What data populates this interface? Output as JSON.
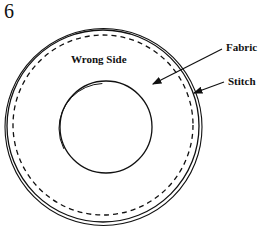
{
  "diagram": {
    "step_number": "6",
    "labels": {
      "wrong_side": "Wrong Side",
      "fabric": "Fabric",
      "stitch": "Stitch"
    },
    "colors": {
      "ink": "#111111",
      "background": "#ffffff"
    },
    "shapes": {
      "outer_circle": {
        "cx": 103,
        "cy": 126,
        "r": 96
      },
      "outer_circle_edge": {
        "cx": 103,
        "cy": 127,
        "r": 98
      },
      "stitch_line": {
        "cx": 103,
        "cy": 126,
        "r": 90,
        "style": "dashed"
      },
      "inner_circle": {
        "cx": 106,
        "cy": 127,
        "r": 46
      },
      "inner_circle_edge": {
        "cx": 104,
        "cy": 128,
        "r": 45
      }
    },
    "arrows": [
      {
        "label": "Fabric",
        "from": [
          222,
          49
        ],
        "to": [
          152,
          84
        ]
      },
      {
        "label": "Stitch",
        "from": [
          224,
          82
        ],
        "to": [
          193,
          93
        ]
      }
    ]
  }
}
